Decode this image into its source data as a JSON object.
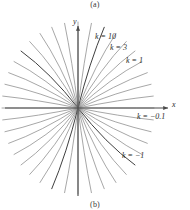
{
  "figure": {
    "caption_above": "(a)",
    "caption_below": "(b)",
    "axis_x_label": "x",
    "axis_y_label": "y"
  },
  "labels": {
    "k10": "k = 10",
    "k3": "k = 3",
    "k1": "k = 1",
    "kneg01": "k = −0.1",
    "kneg1": "k = −1"
  },
  "chart_data": {
    "type": "line",
    "title": "",
    "subtitle": "",
    "xlabel": "x",
    "ylabel": "y",
    "grid": false,
    "legend_position": "inline-annotations",
    "origin": [
      78,
      108
    ],
    "axis_ranges": {
      "x_pixels": [
        5,
        170
      ],
      "y_pixels": [
        22,
        196
      ]
    },
    "annotations": [
      {
        "text": "k = 10",
        "value": 10,
        "at": [
          95,
          33
        ]
      },
      {
        "text": "k = 3",
        "value": 3,
        "at": [
          110,
          44
        ]
      },
      {
        "text": "k = 1",
        "value": 1,
        "at": [
          126,
          57
        ]
      },
      {
        "text": "k = −0.1",
        "value": -0.1,
        "at": [
          137,
          113
        ]
      },
      {
        "text": "k = −1",
        "value": -1,
        "at": [
          122,
          152
        ]
      }
    ],
    "series": [
      {
        "name": "k = 10",
        "k": 10,
        "emphasis": "dark",
        "angle_deg": 72
      },
      {
        "name": "k = 3",
        "k": 3,
        "emphasis": "normal",
        "angle_deg": 64
      },
      {
        "name": "k = 1",
        "k": 1,
        "emphasis": "normal",
        "angle_deg": 45
      },
      {
        "name": "k = -0.1",
        "k": -0.1,
        "emphasis": "normal",
        "angle_deg": -6
      },
      {
        "name": "k = -1",
        "k": -1,
        "emphasis": "dark",
        "angle_deg": -45
      }
    ],
    "curve_count": 40,
    "curve_angles_deg": [
      0,
      9,
      18,
      27,
      36,
      45,
      54,
      63,
      72,
      81,
      90,
      99,
      108,
      117,
      126,
      135,
      144,
      153,
      162,
      171,
      180,
      189,
      198,
      207,
      216,
      225,
      234,
      243,
      252,
      261,
      270,
      279,
      288,
      297,
      306,
      315,
      324,
      333,
      342,
      351
    ],
    "values": []
  },
  "colors": {
    "curve": "#8a8a8a",
    "curve_dark": "#3f3f3f",
    "axis": "#4a4a4a",
    "text": "#2b2b2b",
    "background": "#ffffff"
  }
}
